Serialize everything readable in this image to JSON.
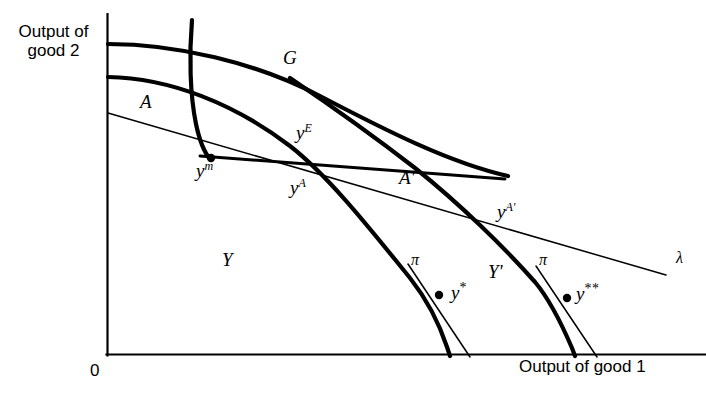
{
  "figure": {
    "background": "#ffffff",
    "stroke_color": "#000000",
    "axis": {
      "origin_label": "0",
      "y_axis_label": "Output of good 2",
      "y_axis_label_line1": "Output of",
      "y_axis_label_line2": "good 2",
      "x_axis_label": "Output of good 1",
      "origin_px": [
        107,
        355
      ],
      "x_axis_end_px": [
        706,
        355
      ],
      "y_axis_top_px": [
        107,
        14
      ]
    },
    "curves": [
      {
        "name": "G",
        "label": "G",
        "style": "thick",
        "description": "upper transformation frontier including government good"
      },
      {
        "name": "Y",
        "label": "Y",
        "style": "thick",
        "description": "private production possibility frontier"
      },
      {
        "name": "A",
        "label": "A",
        "style": "thick",
        "description": "steep curve descending to autarky point y-m"
      },
      {
        "name": "Y-prime",
        "label": "Y'",
        "style": "thick",
        "description": "shifted production possibility frontier"
      },
      {
        "name": "lambda",
        "label": "λ",
        "style": "thin",
        "description": "world price / budget line"
      },
      {
        "name": "pi-left",
        "label": "π",
        "style": "thin",
        "description": "tangent price line at y*"
      },
      {
        "name": "pi-right",
        "label": "π",
        "style": "thin",
        "description": "tangent price line at y**"
      }
    ],
    "points": [
      {
        "id": "ym",
        "label": "y",
        "sup": "m",
        "x": 208,
        "y": 158,
        "dot": true
      },
      {
        "id": "ystar",
        "label": "y",
        "sup": "*",
        "x": 439,
        "y": 295,
        "dot": true
      },
      {
        "id": "ystarstar",
        "label": "y",
        "sup": "**",
        "x": 567,
        "y": 298,
        "dot": true
      }
    ],
    "labels": {
      "G": "G",
      "A": "A",
      "A_prime": "A'",
      "Y": "Y",
      "Y_prime": "Y'",
      "lambda": "λ",
      "pi_left": "π",
      "pi_right": "π",
      "y_m": "y",
      "y_m_sup": "m",
      "y_E": "y",
      "y_E_sup": "E",
      "y_A": "y",
      "y_A_sup": "A",
      "y_A_prime": "y",
      "y_A_prime_sup": "A'",
      "y_star": "y",
      "y_star_sup": "*",
      "y_starstar": "y",
      "y_starstar_sup": "**"
    }
  }
}
